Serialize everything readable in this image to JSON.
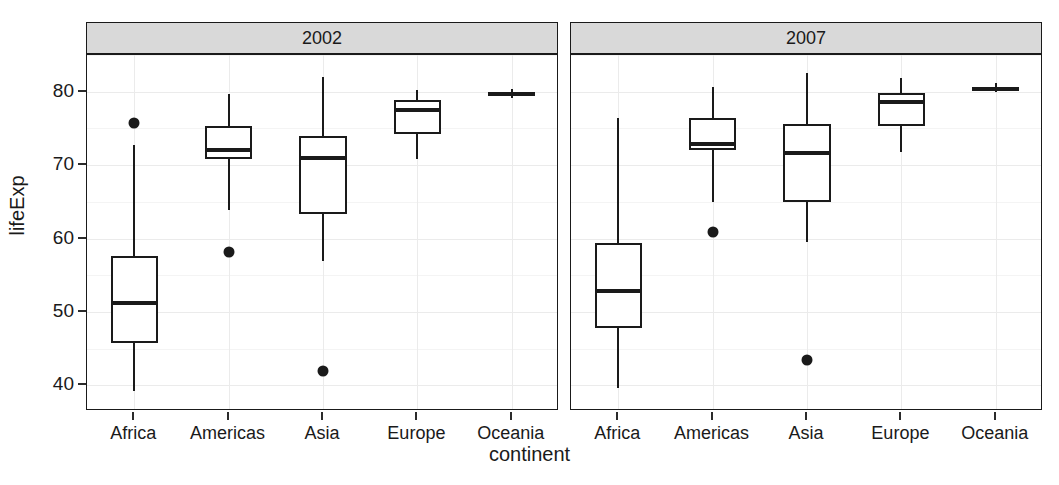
{
  "chart_data": {
    "type": "box",
    "title": "",
    "xlabel": "continent",
    "ylabel": "lifeExp",
    "grid": true,
    "legend": "none",
    "facet_variable": "year",
    "facets": [
      {
        "label": "2002",
        "categories": [
          "Africa",
          "Americas",
          "Asia",
          "Europe",
          "Oceania"
        ],
        "boxes": [
          {
            "category": "Africa",
            "min": 39.2,
            "q1": 45.8,
            "median": 51.2,
            "q3": 57.6,
            "max": 72.8,
            "outliers": [
              75.7
            ]
          },
          {
            "category": "Americas",
            "min": 63.9,
            "q1": 70.8,
            "median": 72.0,
            "q3": 75.3,
            "max": 79.7,
            "outliers": [
              58.2
            ]
          },
          {
            "category": "Asia",
            "min": 56.9,
            "q1": 63.4,
            "median": 71.0,
            "q3": 74.0,
            "max": 82.0,
            "outliers": [
              42.0
            ]
          },
          {
            "category": "Europe",
            "min": 70.8,
            "q1": 74.2,
            "median": 77.5,
            "q3": 78.9,
            "max": 80.2,
            "outliers": []
          },
          {
            "category": "Oceania",
            "min": 79.1,
            "q1": 79.4,
            "median": 79.7,
            "q3": 79.9,
            "max": 80.4,
            "outliers": []
          }
        ]
      },
      {
        "label": "2007",
        "categories": [
          "Africa",
          "Americas",
          "Asia",
          "Europe",
          "Oceania"
        ],
        "boxes": [
          {
            "category": "Africa",
            "min": 39.6,
            "q1": 47.8,
            "median": 52.9,
            "q3": 59.4,
            "max": 76.4,
            "outliers": []
          },
          {
            "category": "Americas",
            "min": 65.0,
            "q1": 72.1,
            "median": 72.9,
            "q3": 76.4,
            "max": 80.7,
            "outliers": [
              60.9
            ]
          },
          {
            "category": "Asia",
            "min": 59.5,
            "q1": 65.0,
            "median": 71.7,
            "q3": 75.6,
            "max": 82.6,
            "outliers": [
              43.5
            ]
          },
          {
            "category": "Europe",
            "min": 71.8,
            "q1": 75.3,
            "median": 78.6,
            "q3": 79.8,
            "max": 81.8,
            "outliers": []
          },
          {
            "category": "Oceania",
            "min": 80.0,
            "q1": 80.2,
            "median": 80.4,
            "q3": 80.6,
            "max": 81.2,
            "outliers": []
          }
        ]
      }
    ],
    "y_ticks": [
      40,
      50,
      60,
      70,
      80
    ],
    "y_tick_labels": [
      "40",
      "50",
      "60",
      "70",
      "80"
    ],
    "ylim": [
      36.5,
      85.0
    ],
    "colors": {
      "box_fill": "#ffffff",
      "line": "#1a1a1a",
      "strip_background": "#d9d9d9",
      "gridline": "#ebebeb",
      "panel_background": "#ffffff"
    }
  },
  "axes": {
    "y_title": "lifeExp",
    "x_title": "continent"
  }
}
